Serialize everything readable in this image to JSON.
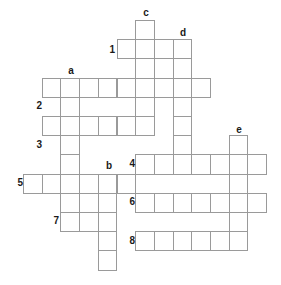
{
  "puzzle": {
    "type": "crossword-grid",
    "width": 281,
    "height": 285,
    "cell_size": 18.7,
    "cell_height": 19.2,
    "origin_x": 23,
    "origin_y": 20,
    "border_color": "#9a9a9a",
    "label_color": "#1a1a1a",
    "background_color": "#ffffff",
    "across_entries": [
      {
        "label": "1",
        "row": 1,
        "col_start": 5,
        "length": 4
      },
      {
        "label": "2",
        "row": 3,
        "col_start": 1,
        "length": 9
      },
      {
        "label": "3",
        "row": 5,
        "col_start": 1,
        "length": 5
      },
      {
        "label": "4",
        "row": 7,
        "col_start": 6,
        "length": 7
      },
      {
        "label": "5",
        "row": 8,
        "col_start": 0,
        "length": 6
      },
      {
        "label": "6",
        "row": 9,
        "col_start": 6,
        "length": 7
      },
      {
        "label": "7",
        "row": 10,
        "col_start": 2,
        "length": 3
      },
      {
        "label": "8",
        "row": 11,
        "col_start": 6,
        "length": 6
      }
    ],
    "down_entries": [
      {
        "label": "a",
        "col": 2,
        "row_start": 3,
        "length": 8
      },
      {
        "label": "b",
        "col": 4,
        "row_start": 8,
        "length": 5
      },
      {
        "label": "c",
        "col": 6,
        "row_start": 0,
        "length": 6
      },
      {
        "label": "d",
        "col": 8,
        "row_start": 1,
        "length": 6
      },
      {
        "label": "e",
        "col": 11,
        "row_start": 6,
        "length": 6
      }
    ],
    "row_number_labels": [
      {
        "text": "1",
        "x": 103,
        "y": 45
      },
      {
        "text": "2",
        "x": 30,
        "y": 101
      },
      {
        "text": "3",
        "x": 30,
        "y": 140
      },
      {
        "text": "4",
        "x": 123,
        "y": 159
      },
      {
        "text": "5",
        "x": 11,
        "y": 178
      },
      {
        "text": "6",
        "x": 123,
        "y": 197
      },
      {
        "text": "7",
        "x": 47,
        "y": 216
      },
      {
        "text": "8",
        "x": 123,
        "y": 236
      }
    ],
    "column_letter_labels": [
      {
        "text": "a",
        "x": 65,
        "y": 66
      },
      {
        "text": "b",
        "x": 103,
        "y": 161
      },
      {
        "text": "c",
        "x": 140,
        "y": 8
      },
      {
        "text": "d",
        "x": 177,
        "y": 28
      },
      {
        "text": "e",
        "x": 233,
        "y": 125
      }
    ]
  }
}
